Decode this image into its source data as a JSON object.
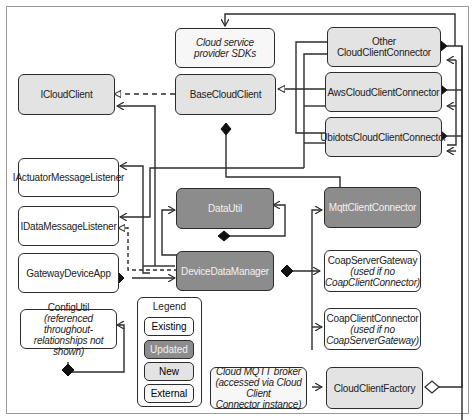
{
  "diagram": {
    "boxes": {
      "cloud_sdks": {
        "line1": "Cloud service",
        "line2": "provider SDKs",
        "category": "External"
      },
      "icloudclient": {
        "label": "ICloudClient",
        "category": "New"
      },
      "basecloudclient": {
        "label": "BaseCloudClient",
        "category": "New"
      },
      "other_connector": {
        "label": "Other CloudClientConnector",
        "category": "New"
      },
      "aws_connector": {
        "label": "AwsCloudClientConnector",
        "category": "New"
      },
      "ubidots_connector": {
        "label": "UbidotsCloudClientConnector",
        "category": "New"
      },
      "iactuator_listener": {
        "label": "IActuatorMessageListener",
        "category": "Existing"
      },
      "idata_listener": {
        "label": "IDataMessageListener",
        "category": "Existing"
      },
      "gateway_app": {
        "label": "GatewayDeviceApp",
        "category": "Existing"
      },
      "datautil": {
        "label": "DataUtil",
        "category": "Updated"
      },
      "device_data_manager": {
        "label": "DeviceDataManager",
        "category": "Updated"
      },
      "mqtt_connector": {
        "label": "MqttClientConnector",
        "category": "Updated"
      },
      "coap_server": {
        "line1": "CoapServerGateway",
        "line2": "(used if no",
        "line3": "CoapClientConnector)",
        "category": "Existing"
      },
      "coap_client": {
        "line1": "CoapClientConnector",
        "line2": "(used if no",
        "line3": "CoapServerGateway)",
        "category": "Existing"
      },
      "configutil": {
        "line1": "ConfigUtil",
        "line2": "(referenced throughout-",
        "line3": "relationships not shown)",
        "category": "Existing"
      },
      "cloud_mqtt_broker": {
        "line1": "Cloud MQTT broker",
        "line2": "(accessed via Cloud Client",
        "line3": "Connector instance)",
        "category": "External"
      },
      "cloud_client_factory": {
        "label": "CloudClientFactory",
        "category": "New"
      }
    },
    "legend": {
      "title": "Legend",
      "items": [
        "Existing",
        "Updated",
        "New",
        "External"
      ]
    },
    "colors": {
      "existing": "#ffffff",
      "updated": "#8c8c8c",
      "new": "#e3e3e3",
      "external": "#f7f7f7",
      "line": "#2c2c2c"
    }
  }
}
